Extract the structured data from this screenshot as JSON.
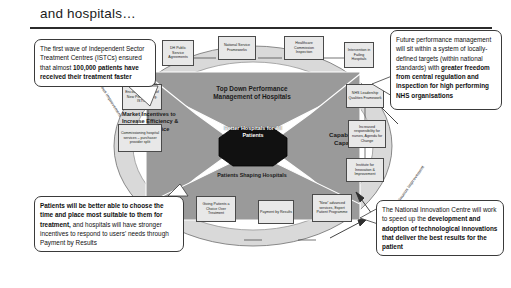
{
  "slide": {
    "title": "and hospitals…"
  },
  "diagram": {
    "hub_label": "Better Hospitals for All Patients",
    "quadrants": [
      {
        "id": "top-down",
        "label": "Top Down Performance Management of Hospitals"
      },
      {
        "id": "market",
        "label": "Market Incentives to Increase Efficiency & Quality of Service"
      },
      {
        "id": "capability",
        "label": "Capability & Capacity"
      },
      {
        "id": "patients",
        "label": "Patients Shaping Hospitals"
      }
    ],
    "ring_labels": [
      {
        "id": "left",
        "label": "Continuous improvement"
      },
      {
        "id": "right",
        "label": "Continuous improvement"
      }
    ],
    "top_boxes": [
      {
        "label": "DH Public Service Agreements"
      },
      {
        "label": "National Service Frameworks"
      },
      {
        "label": "Healthcare Commission Inspection"
      },
      {
        "label": "Intervention in Failing Hospitals"
      }
    ],
    "left_boxes": [
      {
        "label": "Encouraging Entry of New Providers e.g. ISTCs"
      },
      {
        "label": "Commissioning hospital services – purchaser provider split"
      }
    ],
    "right_boxes": [
      {
        "label": "NHS Leadership Qualities Framework"
      },
      {
        "label": "Increased responsibility for nurses, Agenda for Change"
      },
      {
        "label": "Institute for Innovation & Improvement"
      }
    ],
    "bottom_boxes": [
      {
        "label": "Giving Patients a Choice Over Treatment"
      },
      {
        "label": "Payment by Results"
      },
      {
        "label": "“New” advanced services, Expert Patient Programme"
      }
    ]
  },
  "callouts": {
    "istc": {
      "normal": "The first wave of Independent Sector Treatment Centres (ISTCs) ensured that almost ",
      "bold": "100,000 patients have received their treatment faster"
    },
    "performance": {
      "normal": "Future performance management will sit within a system of locally-defined targets (within national standards) with ",
      "bold": "greater freedom from central regulation and inspection for high performing NHS organisations"
    },
    "choice": {
      "bold": "Patients will be better able to choose the time and place most suitable to them for treatment,",
      "normal": " and hospitals will have stronger incentives to respond to users' needs through Payment by Results"
    },
    "innovation": {
      "normal": "The National Innovation Centre will work to speed up the ",
      "bold": "development and adoption of technological innovations that deliver the best results for the patient"
    }
  },
  "colors": {
    "hub": "#111111",
    "arrow_fill": "#9a9a9a",
    "ring_fill": "#d9d9d9",
    "box_fill": "#e8e8e8",
    "rule": "#2b2b2b"
  }
}
